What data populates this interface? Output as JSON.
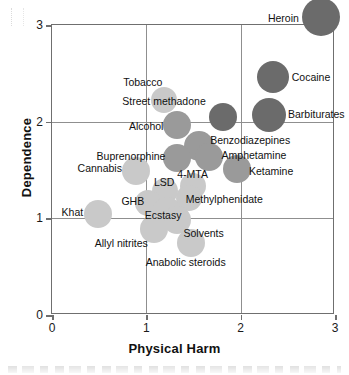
{
  "chart_data": {
    "type": "scatter",
    "title": "",
    "xlabel": "Physical Harm",
    "ylabel": "Dependence",
    "xlim": [
      0,
      3
    ],
    "ylim": [
      0,
      3
    ],
    "xticks": [
      "0",
      "1",
      "2",
      "3"
    ],
    "yticks": [
      "0",
      "1",
      "2",
      "3"
    ],
    "xtick_values": [
      0,
      1,
      2,
      3
    ],
    "ytick_values": [
      0,
      1,
      2,
      3
    ],
    "grid": true,
    "legend": "none",
    "marker": "bubble",
    "colors": {
      "bubble_dark": "#6b6b6b",
      "bubble_mid": "#9a9a9a",
      "bubble_light": "#c9c9c9",
      "axis": "#6f6f6f",
      "grid": "#8f8f8f",
      "text": "#111111"
    },
    "points": [
      {
        "label": "Heroin",
        "x": 2.85,
        "y": 3.08,
        "r": 19,
        "tone": "dark",
        "lx": -22,
        "ly": 1,
        "anchor": "end"
      },
      {
        "label": "Cocaine",
        "x": 2.34,
        "y": 2.46,
        "r": 16,
        "tone": "dark",
        "lx": 19,
        "ly": 0,
        "anchor": "start"
      },
      {
        "label": "Barbiturates",
        "x": 2.3,
        "y": 2.07,
        "r": 17,
        "tone": "dark",
        "lx": 19,
        "ly": -1,
        "anchor": "start"
      },
      {
        "label": "Street methadone",
        "x": 1.81,
        "y": 2.05,
        "r": 14,
        "tone": "dark",
        "lx": -17,
        "ly": -16,
        "anchor": "end"
      },
      {
        "label": "Tobacco",
        "x": 1.19,
        "y": 2.22,
        "r": 13,
        "tone": "light",
        "lx": -2,
        "ly": -18,
        "anchor": "end"
      },
      {
        "label": "Alcohol",
        "x": 1.33,
        "y": 1.97,
        "r": 14,
        "tone": "mid",
        "lx": -14,
        "ly": 1,
        "anchor": "end"
      },
      {
        "label": "Benzodiazepines",
        "x": 1.56,
        "y": 1.75,
        "r": 15,
        "tone": "mid",
        "lx": 11,
        "ly": -6,
        "anchor": "start"
      },
      {
        "label": "Buprenorphine",
        "x": 1.33,
        "y": 1.62,
        "r": 14,
        "tone": "mid",
        "lx": -12,
        "ly": -2,
        "anchor": "end"
      },
      {
        "label": "Amphetamine",
        "x": 1.66,
        "y": 1.63,
        "r": 14,
        "tone": "mid",
        "lx": 13,
        "ly": -2,
        "anchor": "start"
      },
      {
        "label": "Ketamine",
        "x": 1.96,
        "y": 1.51,
        "r": 14,
        "tone": "mid",
        "lx": 12,
        "ly": 2,
        "anchor": "start"
      },
      {
        "label": "Cannabis",
        "x": 0.89,
        "y": 1.49,
        "r": 14,
        "tone": "light",
        "lx": -14,
        "ly": -3,
        "anchor": "end"
      },
      {
        "label": "4-MTA",
        "x": 1.49,
        "y": 1.33,
        "r": 13,
        "tone": "light",
        "lx": 0,
        "ly": -12,
        "anchor": "middle"
      },
      {
        "label": "LSD",
        "x": 1.2,
        "y": 1.28,
        "r": 13,
        "tone": "light",
        "lx": -1,
        "ly": -9,
        "anchor": "middle"
      },
      {
        "label": "Methylphenidate",
        "x": 1.45,
        "y": 1.21,
        "r": 13,
        "tone": "light",
        "lx": -3,
        "ly": 1,
        "anchor": "start"
      },
      {
        "label": "GHB",
        "x": 1.02,
        "y": 1.16,
        "r": 13,
        "tone": "light",
        "lx": -4,
        "ly": -2,
        "anchor": "end"
      },
      {
        "label": "Ecstasy",
        "x": 1.22,
        "y": 1.08,
        "r": 14,
        "tone": "light",
        "lx": -4,
        "ly": 4,
        "anchor": "middle"
      },
      {
        "label": "Khat",
        "x": 0.49,
        "y": 1.05,
        "r": 14,
        "tone": "light",
        "lx": -15,
        "ly": -2,
        "anchor": "end"
      },
      {
        "label": "Solvents",
        "x": 1.33,
        "y": 0.98,
        "r": 14,
        "tone": "light",
        "lx": 6,
        "ly": 13,
        "anchor": "start"
      },
      {
        "label": "Allyl nitrites",
        "x": 1.08,
        "y": 0.89,
        "r": 14,
        "tone": "light",
        "lx": -6,
        "ly": 14,
        "anchor": "end"
      },
      {
        "label": "Anabolic steroids",
        "x": 1.47,
        "y": 0.75,
        "r": 14,
        "tone": "light",
        "lx": -5,
        "ly": 19,
        "anchor": "middle"
      }
    ]
  }
}
